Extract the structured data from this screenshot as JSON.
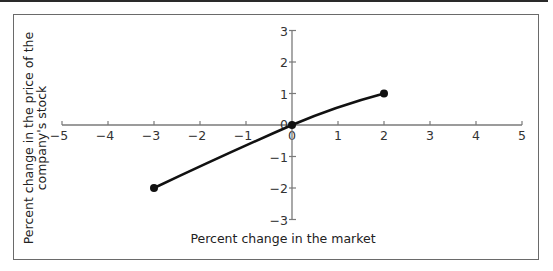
{
  "chart_data": {
    "type": "line",
    "title": "",
    "xlabel": "Percent change in the market",
    "ylabel_line1": "Percent change in the price of the",
    "ylabel_line2": "company's stock",
    "xlim": [
      -5,
      5
    ],
    "ylim": [
      -3,
      3
    ],
    "x_ticks": [
      -5,
      -4,
      -3,
      -2,
      -1,
      0,
      1,
      2,
      3,
      4,
      5
    ],
    "y_ticks": [
      -3,
      -2,
      -1,
      0,
      1,
      2,
      3
    ],
    "x_tick_labels": [
      "−5",
      "−4",
      "−3",
      "−2",
      "−1",
      "0",
      "1",
      "2",
      "3",
      "4",
      "5"
    ],
    "y_tick_labels": [
      "−3",
      "−2",
      "−1",
      "0",
      "1",
      "2",
      "3"
    ],
    "grid": false,
    "legend": null,
    "series": [
      {
        "name": "stock vs market",
        "x": [
          -3,
          0,
          2
        ],
        "y": [
          -2,
          0,
          1
        ],
        "markers": true,
        "color": "#111111"
      }
    ]
  }
}
